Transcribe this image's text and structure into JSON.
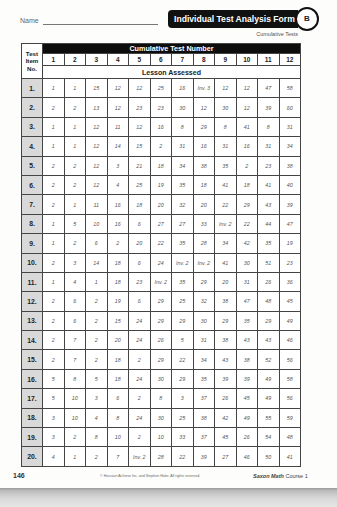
{
  "header": {
    "name_label": "Name",
    "title": "Individual Test Analysis Form",
    "badge": "B",
    "subtitle": "Cumulative Tests"
  },
  "table": {
    "item_header_lines": [
      "Test",
      "Item",
      "No."
    ],
    "group_header": "Cumulative Test Number",
    "columns": [
      "1",
      "2",
      "3",
      "4",
      "5",
      "6",
      "7",
      "8",
      "9",
      "10",
      "11",
      "12"
    ],
    "sub_header": "Lesson Assessed",
    "rows": [
      {
        "item": "1.",
        "values": [
          "1",
          "1",
          "15",
          "12",
          "12",
          "25",
          "16",
          "Inv. 3",
          "12",
          "12",
          "47",
          "58"
        ]
      },
      {
        "item": "2.",
        "values": [
          "2",
          "2",
          "13",
          "12",
          "23",
          "23",
          "30",
          "12",
          "30",
          "12",
          "39",
          "60"
        ]
      },
      {
        "item": "3.",
        "values": [
          "1",
          "1",
          "12",
          "11",
          "12",
          "16",
          "8",
          "29",
          "8",
          "41",
          "8",
          "31"
        ]
      },
      {
        "item": "4.",
        "values": [
          "1",
          "1",
          "12",
          "14",
          "15",
          "2",
          "31",
          "16",
          "31",
          "16",
          "31",
          "34"
        ]
      },
      {
        "item": "5.",
        "values": [
          "2",
          "2",
          "12",
          "3",
          "21",
          "18",
          "34",
          "38",
          "35",
          "2",
          "23",
          "38"
        ]
      },
      {
        "item": "6.",
        "values": [
          "2",
          "2",
          "12",
          "4",
          "25",
          "19",
          "35",
          "18",
          "41",
          "18",
          "41",
          "40"
        ]
      },
      {
        "item": "7.",
        "values": [
          "2",
          "1",
          "11",
          "16",
          "18",
          "20",
          "32",
          "20",
          "22",
          "29",
          "43",
          "39"
        ]
      },
      {
        "item": "8.",
        "values": [
          "1",
          "5",
          "10",
          "16",
          "6",
          "27",
          "27",
          "33",
          "Inv. 2",
          "22",
          "44",
          "47"
        ]
      },
      {
        "item": "9.",
        "values": [
          "1",
          "2",
          "6",
          "2",
          "20",
          "22",
          "35",
          "28",
          "34",
          "42",
          "35",
          "19"
        ]
      },
      {
        "item": "10.",
        "values": [
          "2",
          "3",
          "14",
          "18",
          "6",
          "24",
          "Inv. 2",
          "Inv. 2",
          "41",
          "30",
          "51",
          "23"
        ]
      },
      {
        "item": "11.",
        "values": [
          "1",
          "4",
          "1",
          "18",
          "23",
          "Inv. 2",
          "35",
          "29",
          "20",
          "31",
          "26",
          "36"
        ]
      },
      {
        "item": "12.",
        "values": [
          "2",
          "6",
          "2",
          "19",
          "6",
          "29",
          "25",
          "32",
          "38",
          "47",
          "48",
          "45"
        ]
      },
      {
        "item": "13.",
        "values": [
          "2",
          "6",
          "2",
          "15",
          "24",
          "29",
          "29",
          "30",
          "29",
          "35",
          "29",
          "49"
        ]
      },
      {
        "item": "14.",
        "values": [
          "2",
          "7",
          "2",
          "20",
          "24",
          "26",
          "5",
          "31",
          "38",
          "43",
          "43",
          "46"
        ]
      },
      {
        "item": "15.",
        "values": [
          "2",
          "7",
          "2",
          "18",
          "2",
          "29",
          "22",
          "34",
          "43",
          "38",
          "52",
          "56"
        ]
      },
      {
        "item": "16.",
        "values": [
          "5",
          "8",
          "5",
          "18",
          "24",
          "30",
          "29",
          "35",
          "39",
          "39",
          "49",
          "58"
        ]
      },
      {
        "item": "17.",
        "values": [
          "5",
          "10",
          "3",
          "6",
          "2",
          "8",
          "3",
          "37",
          "26",
          "45",
          "49",
          "56"
        ]
      },
      {
        "item": "18.",
        "values": [
          "3",
          "10",
          "4",
          "8",
          "24",
          "30",
          "25",
          "38",
          "42",
          "49",
          "55",
          "59"
        ]
      },
      {
        "item": "19.",
        "values": [
          "3",
          "2",
          "8",
          "10",
          "2",
          "10",
          "33",
          "37",
          "45",
          "26",
          "54",
          "48"
        ]
      },
      {
        "item": "20.",
        "values": [
          "4",
          "1",
          "2",
          "7",
          "Inv. 2",
          "28",
          "22",
          "39",
          "27",
          "46",
          "50",
          "41"
        ]
      }
    ]
  },
  "footer": {
    "page_number": "146",
    "copyright": "© Harcourt Achieve Inc. and Stephen Hake. All rights reserved.",
    "brand": "Saxon Math",
    "course": " Course 1"
  }
}
